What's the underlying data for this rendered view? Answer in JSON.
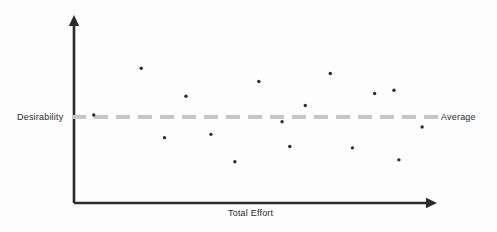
{
  "chart_data": {
    "type": "scatter",
    "title": "",
    "xlabel": "Total Effort",
    "ylabel": "Desirability",
    "xlim": [
      0,
      100
    ],
    "ylim": [
      0,
      100
    ],
    "grid": false,
    "legend_position": "right-inline",
    "points": [
      {
        "x": 3.9,
        "y": 50.0
      },
      {
        "x": 17.4,
        "y": 81.2
      },
      {
        "x": 24.0,
        "y": 34.9
      },
      {
        "x": 30.1,
        "y": 62.5
      },
      {
        "x": 37.2,
        "y": 37.1
      },
      {
        "x": 44.0,
        "y": 18.8
      },
      {
        "x": 50.8,
        "y": 72.3
      },
      {
        "x": 57.4,
        "y": 45.5
      },
      {
        "x": 59.6,
        "y": 29.0
      },
      {
        "x": 64.0,
        "y": 56.3
      },
      {
        "x": 71.1,
        "y": 77.7
      },
      {
        "x": 77.4,
        "y": 28.1
      },
      {
        "x": 83.7,
        "y": 64.3
      },
      {
        "x": 89.2,
        "y": 66.5
      },
      {
        "x": 90.6,
        "y": 20.1
      },
      {
        "x": 97.2,
        "y": 42.0
      }
    ],
    "series": [
      {
        "name": "Options",
        "marker": "dot",
        "marker_color": "#2d2d2d",
        "marker_size": 3.4
      }
    ],
    "reference_line": {
      "label": "Average",
      "orientation": "horizontal",
      "value": 47.0,
      "style": "dashed",
      "color": "#c6c6c6",
      "dash_length": 14,
      "dash_gap": 8,
      "thickness": 4
    },
    "axes": {
      "x_axis": {
        "arrow": true,
        "color": "#2b2b2b"
      },
      "y_axis": {
        "arrow": true,
        "color": "#2b2b2b"
      },
      "tick_labels_x": [],
      "tick_labels_y": []
    }
  },
  "geometry": {
    "origin_x": 74,
    "origin_y": 203,
    "y_axis_top": 15,
    "x_axis_right": 437,
    "baseline_y": 117,
    "plot_left": 80,
    "plot_right": 432,
    "plot_top": 40,
    "plot_bottom": 190
  },
  "colors": {
    "background": "#fdfdfd",
    "axis": "#2b2b2b",
    "marker": "#2d2d2d",
    "reference_line": "#c6c6c6",
    "text": "#2b2b2b"
  },
  "labels": {
    "y_axis_title": "Desirability",
    "x_axis_title": "Total Effort",
    "average_line": "Average"
  }
}
